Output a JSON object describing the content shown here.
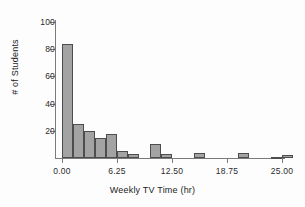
{
  "chart_data": {
    "type": "bar",
    "title": "",
    "subtitle": "",
    "xlabel": "Weekly TV Time (hr)",
    "ylabel": "# of Students",
    "xlim": [
      -1.25,
      26.25
    ],
    "ylim": [
      0,
      104
    ],
    "grid": false,
    "legend": null,
    "bin_width": 1.25,
    "xticks": [
      "0.00",
      "6.25",
      "12.50",
      "18.75",
      "25.00"
    ],
    "xtick_values": [
      0,
      6.25,
      12.5,
      18.75,
      25
    ],
    "yticks": [
      "20",
      "40",
      "60",
      "80",
      "100"
    ],
    "ytick_values": [
      20,
      40,
      60,
      80,
      100
    ],
    "bins": [
      {
        "x0": 0.0,
        "x1": 1.25,
        "count": 84
      },
      {
        "x0": 1.25,
        "x1": 2.5,
        "count": 25
      },
      {
        "x0": 2.5,
        "x1": 3.75,
        "count": 20
      },
      {
        "x0": 3.75,
        "x1": 5.0,
        "count": 15
      },
      {
        "x0": 5.0,
        "x1": 6.25,
        "count": 18
      },
      {
        "x0": 6.25,
        "x1": 7.5,
        "count": 5
      },
      {
        "x0": 7.5,
        "x1": 8.75,
        "count": 3
      },
      {
        "x0": 8.75,
        "x1": 10.0,
        "count": 0
      },
      {
        "x0": 10.0,
        "x1": 11.25,
        "count": 10
      },
      {
        "x0": 11.25,
        "x1": 12.5,
        "count": 3
      },
      {
        "x0": 12.5,
        "x1": 13.75,
        "count": 0
      },
      {
        "x0": 13.75,
        "x1": 15.0,
        "count": 0
      },
      {
        "x0": 15.0,
        "x1": 16.25,
        "count": 4
      },
      {
        "x0": 16.25,
        "x1": 17.5,
        "count": 0
      },
      {
        "x0": 17.5,
        "x1": 18.75,
        "count": 0
      },
      {
        "x0": 18.75,
        "x1": 20.0,
        "count": 0
      },
      {
        "x0": 20.0,
        "x1": 21.25,
        "count": 4
      },
      {
        "x0": 21.25,
        "x1": 22.5,
        "count": 0
      },
      {
        "x0": 22.5,
        "x1": 23.75,
        "count": 0
      },
      {
        "x0": 23.75,
        "x1": 25.0,
        "count": 1
      },
      {
        "x0": 25.0,
        "x1": 26.25,
        "count": 2
      }
    ],
    "categories": [
      "0.00-1.25",
      "1.25-2.50",
      "2.50-3.75",
      "3.75-5.00",
      "5.00-6.25",
      "6.25-7.50",
      "7.50-8.75",
      "8.75-10.00",
      "10.00-11.25",
      "11.25-12.50",
      "12.50-13.75",
      "13.75-15.00",
      "15.00-16.25",
      "16.25-17.50",
      "17.50-18.75",
      "18.75-20.00",
      "20.00-21.25",
      "21.25-22.50",
      "22.50-23.75",
      "23.75-25.00",
      "25.00-26.25"
    ],
    "values": [
      84,
      25,
      20,
      15,
      18,
      5,
      3,
      0,
      10,
      3,
      0,
      0,
      4,
      0,
      0,
      0,
      4,
      0,
      0,
      1,
      2
    ],
    "colors": {
      "bar_fill": "#a3a3a3",
      "bar_edge": "#4d4d4d",
      "axis": "#7a7a7a",
      "text": "#232323",
      "background": "#fdfdfd"
    }
  }
}
